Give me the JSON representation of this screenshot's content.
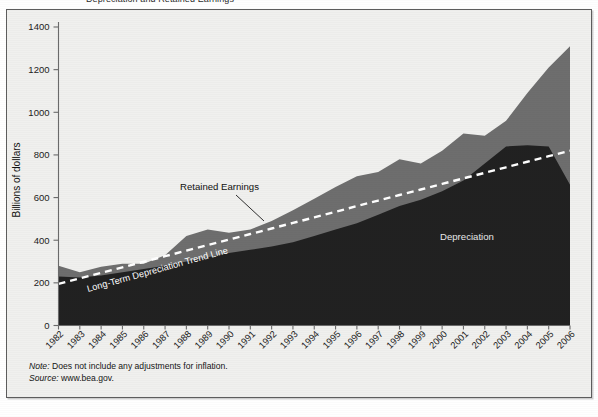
{
  "figure": {
    "clipped_title": "Depreciation and Retained Earnings",
    "notes": {
      "note_label": "Note:",
      "note_text": " Does not include any adjustments for inflation.",
      "source_label": "Source:",
      "source_text": " www.bea.gov."
    },
    "colors": {
      "depreciation": "#212121",
      "retained_earnings": "#6e6e6e",
      "trend_line": "#ffffff",
      "panel_bg": "#f0f0ee",
      "frame": "#5d5d5d",
      "text": "#151515"
    }
  },
  "chart_data": {
    "type": "area",
    "title": "Depreciation and Retained Earnings",
    "xlabel": "",
    "ylabel": "Billions of dollars",
    "ylim": [
      0,
      1400
    ],
    "yticks": [
      0,
      200,
      400,
      600,
      800,
      1000,
      1200,
      1400
    ],
    "ytick_labels": [
      "0",
      "200",
      "400",
      "600",
      "800",
      "1000",
      "1200",
      "1400"
    ],
    "grid": false,
    "legend_position": "inline-annotations",
    "stacked": true,
    "x": [
      1982,
      1983,
      1984,
      1985,
      1986,
      1987,
      1988,
      1989,
      1990,
      1991,
      1992,
      1993,
      1994,
      1995,
      1996,
      1997,
      1998,
      1999,
      2000,
      2001,
      2002,
      2003,
      2004,
      2005,
      2006
    ],
    "xtick_labels": [
      "1982",
      "1983",
      "1984",
      "1985",
      "1986",
      "1987",
      "1988",
      "1989",
      "1990",
      "1991",
      "1992",
      "1993",
      "1994",
      "1995",
      "1996",
      "1997",
      "1998",
      "1999",
      "2000",
      "2001",
      "2002",
      "2003",
      "2004",
      "2005",
      "2006"
    ],
    "series": [
      {
        "name": "Depreciation",
        "color": "#212121",
        "values": [
          230,
          225,
          235,
          250,
          265,
          280,
          300,
          320,
          340,
          355,
          370,
          390,
          420,
          450,
          480,
          520,
          560,
          590,
          630,
          680,
          760,
          840,
          845,
          840,
          660
        ]
      },
      {
        "name": "Retained Earnings",
        "color": "#6e6e6e",
        "values": [
          50,
          25,
          40,
          40,
          25,
          50,
          120,
          130,
          95,
          95,
          120,
          150,
          175,
          200,
          220,
          200,
          220,
          170,
          190,
          220,
          130,
          120,
          245,
          370,
          650
        ]
      }
    ],
    "totals": [
      280,
      250,
      275,
      290,
      290,
      330,
      420,
      450,
      435,
      450,
      490,
      540,
      595,
      650,
      700,
      720,
      780,
      760,
      820,
      900,
      890,
      960,
      1090,
      1210,
      1310
    ],
    "trend_line": {
      "name": "Long-Term Depreciation Trend Line",
      "style": "dashed",
      "color": "#ffffff",
      "start_value": 195,
      "end_value": 820,
      "values": [
        195,
        221,
        247,
        273,
        299,
        325,
        351,
        377,
        403,
        429,
        455,
        481,
        507,
        533,
        560,
        586,
        612,
        638,
        664,
        690,
        716,
        742,
        768,
        794,
        820
      ]
    },
    "annotations": [
      {
        "text": "Retained Earnings",
        "x": 1990,
        "y": 745
      },
      {
        "text": "Depreciation",
        "x": 2001,
        "y": 410
      },
      {
        "text": "Long-Term Depreciation Trend Line",
        "x": 1986,
        "y": 250
      }
    ]
  }
}
